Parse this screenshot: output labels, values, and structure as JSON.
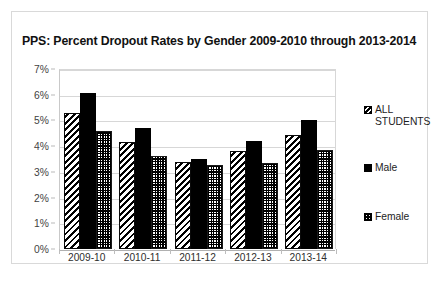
{
  "chart_data": {
    "type": "bar",
    "title": "PPS: Percent Dropout Rates by Gender 2009-2010 through 2013-2014",
    "xlabel": "",
    "ylabel": "",
    "ylim": [
      0,
      7
    ],
    "ytick_labels": [
      "0%",
      "1%",
      "2%",
      "3%",
      "4%",
      "5%",
      "6%",
      "7%"
    ],
    "ytick_values": [
      0,
      1,
      2,
      3,
      4,
      5,
      6,
      7
    ],
    "grid": true,
    "legend_position": "right",
    "categories": [
      "2009-10",
      "2010-11",
      "2011-12",
      "2012-13",
      "2013-14"
    ],
    "series": [
      {
        "name": "ALL\nSTUDENTS",
        "pattern": "diagonal-hatch",
        "values": [
          5.3,
          4.15,
          3.4,
          3.8,
          4.45
        ]
      },
      {
        "name": "Male",
        "pattern": "solid-black",
        "values": [
          6.05,
          4.7,
          3.5,
          4.2,
          5.0
        ]
      },
      {
        "name": "Female",
        "pattern": "checkerboard",
        "values": [
          4.6,
          3.6,
          3.25,
          3.35,
          3.85
        ]
      }
    ]
  },
  "colors": {
    "ink": "#000000",
    "frame_border": "#d9d9d9",
    "gridline": "#d7d7d7",
    "axis_line": "#b0b0b0",
    "background": "#ffffff"
  }
}
